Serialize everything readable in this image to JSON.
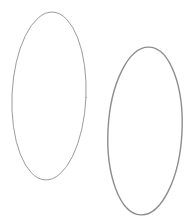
{
  "canvas": {
    "width": 194,
    "height": 223,
    "background_color": "#ffffff",
    "title": "Two Ellipses"
  },
  "shapes": [
    {
      "name": "ellipse-left",
      "type": "ellipse",
      "label": "Left ellipse",
      "center_x": 49,
      "center_y": 96,
      "radius_x": 37,
      "radius_y": 84,
      "rotation_deg": 2.5,
      "stroke_color": "#9b9b9b",
      "stroke_width": 1,
      "fill": "none"
    },
    {
      "name": "ellipse-right",
      "type": "ellipse",
      "label": "Right ellipse",
      "center_x": 145,
      "center_y": 131,
      "radius_x": 37,
      "radius_y": 84,
      "rotation_deg": 3,
      "stroke_color": "#8d8d8d",
      "stroke_width": 1.4,
      "fill": "none"
    }
  ]
}
